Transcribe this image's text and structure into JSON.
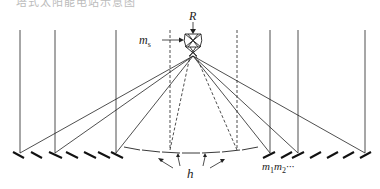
{
  "caption": "塔式太阳能电站示意图",
  "labels": {
    "receiver": "R",
    "secondary_mirror": "m",
    "secondary_mirror_sub": "s",
    "heliostats_m1": "m",
    "heliostats_m1_sub": "1",
    "heliostats_m2": "m",
    "heliostats_m2_sub": "2",
    "heliostats_ellipsis": "···",
    "height": "h"
  },
  "colors": {
    "line": "#222222",
    "background": "#ffffff"
  },
  "geometry": {
    "tower_center_x": 193,
    "focus_y": 56,
    "ground_y": 156,
    "sun_rays_x": [
      20,
      55,
      116,
      270,
      298,
      365
    ],
    "dashed_x": [
      170,
      237
    ]
  }
}
